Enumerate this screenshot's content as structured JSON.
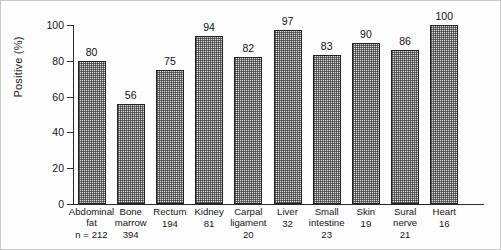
{
  "chart_data": {
    "type": "bar",
    "title": "",
    "xlabel": "",
    "ylabel": "Positive (%)",
    "ylim": [
      0,
      100
    ],
    "yticks": [
      0,
      20,
      40,
      60,
      80,
      100
    ],
    "ytick_labels": [
      "0",
      "20",
      "40",
      "60",
      "80",
      "100"
    ],
    "grid": false,
    "legend": null,
    "categories": [
      "Abdominal\nfat",
      "Bone\nmarrow",
      "Rectum",
      "Kidney",
      "Carpal\nligament",
      "Liver",
      "Small\nintestine",
      "Skin",
      "Sural\nnerve",
      "Heart"
    ],
    "values": [
      80,
      56,
      75,
      94,
      82,
      97,
      83,
      90,
      86,
      100
    ],
    "value_labels": [
      "80",
      "56",
      "75",
      "94",
      "82",
      "97",
      "83",
      "90",
      "86",
      "100"
    ],
    "sample_sizes": [
      "n = 212",
      "394",
      "194",
      "81",
      "20",
      "32",
      "23",
      "19",
      "21",
      "16"
    ],
    "bar_fill": "#d9d9d9",
    "bar_edge": "#222222",
    "bar_pattern": "cross-hatch-dots"
  }
}
